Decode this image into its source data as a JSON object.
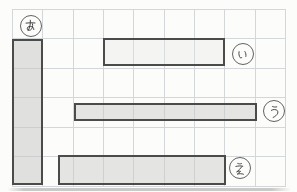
{
  "figure": {
    "kind": "grid-length-comparison-worksheet",
    "grid": {
      "columns": 9,
      "rows": 6,
      "cell_size_px": 30,
      "line_color": "#d3d7d9"
    },
    "bars": [
      {
        "id": "a",
        "label": "あ",
        "orientation": "vertical",
        "length_units": 5,
        "thickness_units": 1
      },
      {
        "id": "i",
        "label": "い",
        "orientation": "horizontal",
        "length_units": 4,
        "thickness_units": 1
      },
      {
        "id": "u",
        "label": "う",
        "orientation": "horizontal",
        "length_units": 6,
        "thickness_units": 0.6
      },
      {
        "id": "e",
        "label": "え",
        "orientation": "horizontal",
        "length_units": 5.5,
        "thickness_units": 1
      }
    ],
    "colors": {
      "background": "#fcfcfa",
      "bar_border": "#4b4b49",
      "badge_border": "#626260",
      "bar_fill_a": "#e4e4e3",
      "bar_fill_i": "#f3f3f1",
      "bar_fill_u": "#e7e7e5",
      "bar_fill_e": "#e7e7e5"
    }
  }
}
